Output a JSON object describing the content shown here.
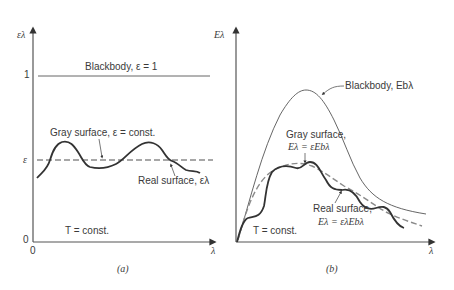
{
  "figure": {
    "panel_a": {
      "caption": "(a)",
      "y_axis_label": "ελ",
      "x_axis_label": "λ",
      "y_ticks": [
        "1",
        "ε",
        "0"
      ],
      "x_ticks": [
        "0"
      ],
      "blackbody_label": "Blackbody, ε = 1",
      "gray_label": "Gray surface, ε = const.",
      "real_label": "Real surface, ελ",
      "temperature_label": "T = const."
    },
    "panel_b": {
      "caption": "(b)",
      "y_axis_label": "Eλ",
      "x_axis_label": "λ",
      "blackbody_label": "Blackbody, Ebλ",
      "gray_label_line1": "Gray surface,",
      "gray_label_line2": "Eλ = εEbλ",
      "real_label_line1": "Real surface,",
      "real_label_line2": "Eλ = ελEbλ",
      "temperature_label": "T = const."
    },
    "colors": {
      "axis": "#555555",
      "real_curve": "#333333",
      "gray_dashed": "#8a8a8a",
      "text": "#3a3a3a"
    }
  }
}
